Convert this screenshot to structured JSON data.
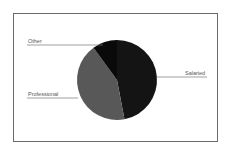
{
  "chart_data": {
    "type": "pie",
    "title": "",
    "categories": [
      "Salaried",
      "Professional",
      "Other"
    ],
    "values": [
      47,
      43,
      10
    ],
    "colors": [
      "#141414",
      "#585858",
      "#0a0a0a"
    ],
    "start_angle_deg": 0,
    "direction": "clockwise",
    "legend": "none",
    "labels_with_leader_lines": true
  },
  "labels": {
    "salaried": "Salaried",
    "professional": "Professional",
    "other": "Other"
  }
}
